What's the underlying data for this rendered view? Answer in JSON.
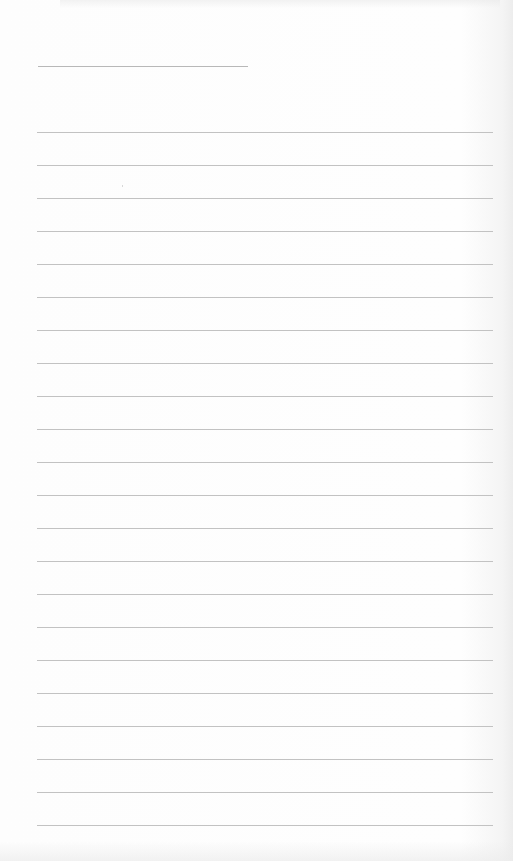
{
  "sheet": {
    "type": "lined-paper",
    "background_color": "#fdfdfd",
    "line_color": "#c2c2c2",
    "title_line": {
      "x": 38,
      "y": 66,
      "width": 210
    },
    "ruled_lines": {
      "count": 22,
      "first_y": 132,
      "spacing": 33,
      "x_start": 37,
      "x_end": 493
    }
  }
}
